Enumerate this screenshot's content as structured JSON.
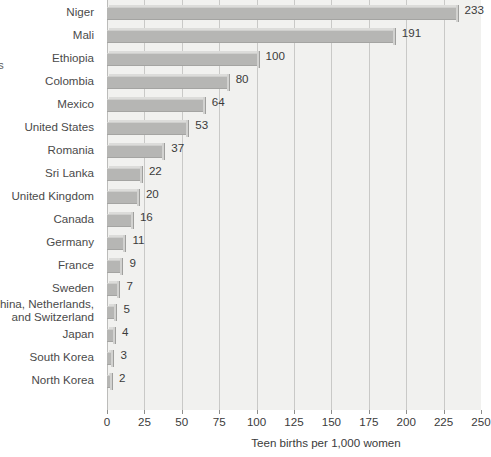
{
  "edge_fragment": "s",
  "chart_data": {
    "type": "bar",
    "orientation": "horizontal",
    "title": "",
    "xlabel": "Teen births per 1,000 women",
    "ylabel": "",
    "xlim": [
      0,
      250
    ],
    "xticks": [
      0,
      25,
      50,
      75,
      100,
      125,
      150,
      175,
      200,
      225,
      250
    ],
    "xtick_labels": [
      "0",
      "25",
      "50",
      "75",
      "100",
      "125",
      "150",
      "175",
      "200",
      "225",
      "250"
    ],
    "grid": true,
    "legend": null,
    "bar_color": "#b6b6b4",
    "plot_background": "#f1f1ef",
    "categories": [
      "Niger",
      "Mali",
      "Ethiopia",
      "Colombia",
      "Mexico",
      "United States",
      "Romania",
      "Sri Lanka",
      "United Kingdom",
      "Canada",
      "Germany",
      "France",
      "Sweden",
      "China, Netherlands, and Switzerland",
      "Japan",
      "South Korea",
      "North Korea"
    ],
    "values": [
      233,
      191,
      100,
      80,
      64,
      53,
      37,
      22,
      20,
      16,
      11,
      9,
      7,
      5,
      4,
      3,
      2
    ],
    "value_labels": [
      "233",
      "191",
      "100",
      "80",
      "64",
      "53",
      "37",
      "22",
      "20",
      "16",
      "11",
      "9",
      "7",
      "5",
      "4",
      "3",
      "2"
    ]
  }
}
